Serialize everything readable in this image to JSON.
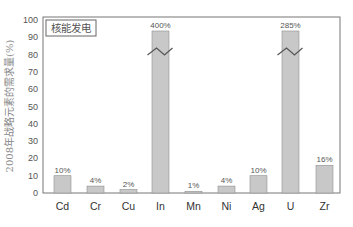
{
  "chart_data": {
    "type": "bar",
    "title": "核能发电",
    "xlabel": "",
    "ylabel": "2008年战略元素的需求量(%)",
    "ylim": [
      0,
      100
    ],
    "yticks": [
      0,
      10,
      20,
      30,
      40,
      50,
      60,
      70,
      80,
      90,
      100
    ],
    "grid": false,
    "legend_position": "top-left (boxed label)",
    "categories": [
      "Cd",
      "Cr",
      "Cu",
      "In",
      "Mn",
      "Ni",
      "Ag",
      "U",
      "Zr"
    ],
    "values": [
      10,
      4,
      2,
      400,
      1,
      4,
      10,
      285,
      16
    ],
    "value_labels": [
      "10%",
      "4%",
      "2%",
      "400%",
      "1%",
      "4%",
      "10%",
      "285%",
      "16%"
    ],
    "broken_axis_bars": [
      "In",
      "U"
    ],
    "annotations": [
      "Bars for In (400%) and U (285%) exceed the axis and are drawn with a break (zigzag) mark"
    ]
  },
  "colors": {
    "bar_fill": "#c8c8c8",
    "bar_stroke": "#8f8f8f",
    "axis": "#777777",
    "break_mark": "#555555"
  }
}
